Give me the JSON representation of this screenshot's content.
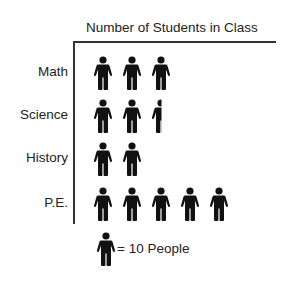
{
  "chart_data": {
    "type": "pictograph",
    "title": "Number of Students in Class",
    "categories": [
      "Math",
      "Science",
      "History",
      "P.E."
    ],
    "icon_counts": [
      3,
      2.5,
      2,
      5
    ],
    "values": [
      30,
      25,
      20,
      50
    ],
    "legend": {
      "icon": "person-icon",
      "text": "= 10 People",
      "value_per_icon": 10
    },
    "xlabel": "",
    "ylabel": ""
  },
  "colors": {
    "icon": "#111111",
    "text": "#222222",
    "axis": "#333333"
  }
}
